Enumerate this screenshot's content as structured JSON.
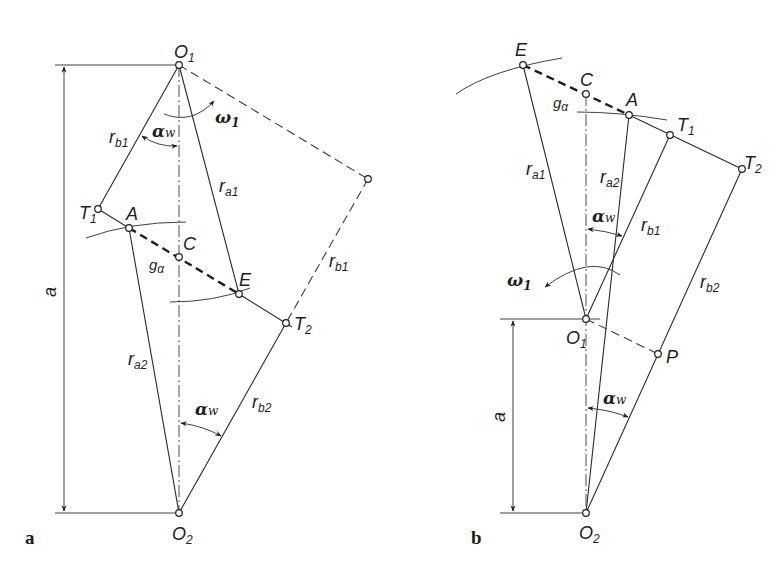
{
  "figure": {
    "panels": [
      {
        "id": "a",
        "panel_label": "a",
        "points": {
          "O1": {
            "label": "O",
            "sub": "1"
          },
          "O2": {
            "label": "O",
            "sub": "2"
          },
          "T1": {
            "label": "T",
            "sub": "1"
          },
          "T2": {
            "label": "T",
            "sub": "2"
          },
          "A": {
            "label": "A"
          },
          "C": {
            "label": "C"
          },
          "E": {
            "label": "E"
          }
        },
        "segments": {
          "rb1": {
            "label": "r",
            "sub": "b1"
          },
          "rb1_dashed": {
            "label": "r",
            "sub": "b1"
          },
          "ra1": {
            "label": "r",
            "sub": "a1"
          },
          "ra2": {
            "label": "r",
            "sub": "a2"
          },
          "rb2": {
            "label": "r",
            "sub": "b2"
          },
          "g_alpha": {
            "label": "g",
            "sub": "α"
          }
        },
        "angles": {
          "alpha_w_top": {
            "label": "α",
            "sub": "w"
          },
          "alpha_w_bottom": {
            "label": "α",
            "sub": "w"
          }
        },
        "rotation": {
          "label": "ω",
          "sub": "1"
        },
        "dimension": {
          "label": "a"
        }
      },
      {
        "id": "b",
        "panel_label": "b",
        "points": {
          "E": {
            "label": "E"
          },
          "C": {
            "label": "C"
          },
          "A": {
            "label": "A"
          },
          "T1": {
            "label": "T",
            "sub": "1"
          },
          "T2": {
            "label": "T",
            "sub": "2"
          },
          "O1": {
            "label": "O",
            "sub": "1"
          },
          "O2": {
            "label": "O",
            "sub": "2"
          },
          "P": {
            "label": "P"
          }
        },
        "segments": {
          "ra1": {
            "label": "r",
            "sub": "a1"
          },
          "ra2": {
            "label": "r",
            "sub": "a2"
          },
          "rb1": {
            "label": "r",
            "sub": "b1"
          },
          "rb2": {
            "label": "r",
            "sub": "b2"
          },
          "g_alpha": {
            "label": "g",
            "sub": "α"
          }
        },
        "angles": {
          "alpha_w_top": {
            "label": "α",
            "sub": "w"
          },
          "alpha_w_bottom": {
            "label": "α",
            "sub": "w"
          }
        },
        "rotation": {
          "label": "ω",
          "sub": "1"
        },
        "dimension": {
          "label": "a"
        }
      }
    ]
  }
}
